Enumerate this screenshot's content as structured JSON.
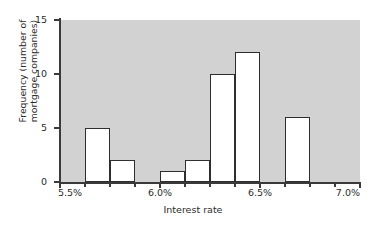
{
  "chart_data": {
    "type": "bar",
    "subtype": "histogram",
    "title": "",
    "xlabel": "Interest rate",
    "ylabel": "Frequency (number of mortgage companies)",
    "ylabel_lines": [
      "Frequency (number of",
      "mortgage companies)"
    ],
    "xlim": [
      5.5,
      7.0
    ],
    "ylim": [
      0,
      15
    ],
    "bin_width": 0.125,
    "grid": false,
    "legend": null,
    "legend_position": "none",
    "bar_fill_color": "#ffffff",
    "bar_edge_color": "#2e2e2e",
    "plot_background_color": "#d2d2d2",
    "figure_background_color": "#ffffff",
    "x_tick_labels": [
      "5.5%",
      "6.0%",
      "6.5%",
      "7.0%"
    ],
    "x_tick_values": [
      5.5,
      6.0,
      6.5,
      7.0
    ],
    "x_minor_tick_values": [
      5.625,
      5.75,
      5.875,
      6.125,
      6.25,
      6.375,
      6.625,
      6.75,
      6.875
    ],
    "y_tick_labels": [
      "0",
      "5",
      "10",
      "15"
    ],
    "y_tick_values": [
      0,
      5,
      10,
      15
    ],
    "categories": [
      "5.500-5.625",
      "5.625-5.750",
      "5.750-5.875",
      "5.875-6.000",
      "6.000-6.125",
      "6.125-6.250",
      "6.250-6.375",
      "6.375-6.500",
      "6.500-6.625",
      "6.625-6.750",
      "6.750-6.875",
      "6.875-7.000"
    ],
    "bin_starts": [
      5.5,
      5.625,
      5.75,
      5.875,
      6.0,
      6.125,
      6.25,
      6.375,
      6.5,
      6.625,
      6.75,
      6.875
    ],
    "bin_ends": [
      5.625,
      5.75,
      5.875,
      6.0,
      6.125,
      6.25,
      6.375,
      6.5,
      6.625,
      6.75,
      6.875,
      7.0
    ],
    "values": [
      0,
      5,
      2,
      0,
      1,
      2,
      10,
      12,
      0,
      6,
      0,
      0
    ]
  }
}
